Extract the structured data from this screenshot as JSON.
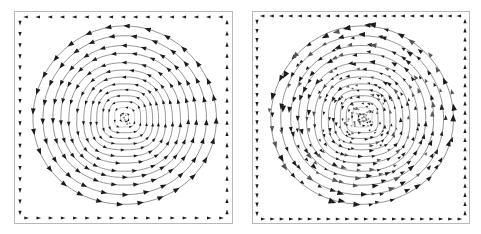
{
  "figure": {
    "title": "",
    "background_color": "#ffffff",
    "width": 481,
    "height": 234,
    "panel_count": 2,
    "frame_color": "#b9b9b9",
    "streamline_color": "#6f6f6f",
    "arrow_color": "#1b1b1b"
  },
  "panels": [
    {
      "id": "left-panel",
      "name": "coarse-arrow-streamline-plot",
      "caption": "",
      "x": 14,
      "y": 11,
      "width": 219,
      "height": 213,
      "arrow_density": "sparse",
      "arrow_count_approx": 300,
      "streamline_count": 13,
      "vortex_center": {
        "x": 0.5,
        "y": 0.5
      },
      "rotation": "counter-clockwise",
      "border_flow": {
        "top": "leftward",
        "bottom": "rightward",
        "left": "downward",
        "right": "upward"
      }
    },
    {
      "id": "right-panel",
      "name": "dense-arrow-streamline-plot",
      "caption": "",
      "x": 252,
      "y": 11,
      "width": 218,
      "height": 213,
      "arrow_density": "dense",
      "arrow_count_approx": 1100,
      "streamline_count": 13,
      "vortex_center": {
        "x": 0.5,
        "y": 0.5
      },
      "rotation": "counter-clockwise",
      "border_flow": {
        "top": "leftward",
        "bottom": "rightward",
        "left": "downward",
        "right": "upward"
      }
    }
  ],
  "chart_data": {
    "type": "line",
    "title": "",
    "subtitle": "",
    "xlabel": "",
    "ylabel": "",
    "xlim": [
      0,
      1
    ],
    "ylim": [
      0,
      1
    ],
    "grid": false,
    "legend": "none",
    "series": [
      {
        "name": "streamline-levels-left",
        "panel": "left-panel",
        "type": "closed-contour",
        "values": [
          0.04,
          0.1,
          0.16,
          0.22,
          0.28,
          0.34,
          0.41,
          0.48,
          0.56,
          0.64,
          0.72,
          0.82,
          0.92
        ],
        "shape_exponent": [
          4.0,
          3.6,
          3.3,
          3.0,
          2.8,
          2.6,
          2.45,
          2.32,
          2.22,
          2.14,
          2.08,
          2.04,
          2.0
        ]
      },
      {
        "name": "streamline-levels-right",
        "panel": "right-panel",
        "type": "closed-contour",
        "values": [
          0.04,
          0.1,
          0.16,
          0.22,
          0.28,
          0.34,
          0.41,
          0.48,
          0.56,
          0.64,
          0.72,
          0.82,
          0.92
        ],
        "shape_exponent": [
          4.0,
          3.6,
          3.3,
          3.0,
          2.8,
          2.6,
          2.45,
          2.32,
          2.22,
          2.14,
          2.08,
          2.04,
          2.0
        ]
      }
    ],
    "annotations": []
  }
}
